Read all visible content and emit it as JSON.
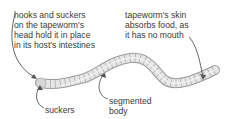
{
  "diagram": {
    "subject": "tapeworm",
    "labels": {
      "hooks": "hooks and suckers\non the tapeworm's\nhead hold it in place\nin its host's intestines",
      "skin": "tapeworm's skin\nabsorbs food, as\nit has no mouth",
      "suckers": "suckers",
      "segmented_body": "segmented\nbody"
    },
    "colors": {
      "body_fill": "#e6e6e6",
      "body_stroke": "#9a9a9a",
      "text": "#3a3a3a",
      "pointer": "#555555"
    }
  }
}
